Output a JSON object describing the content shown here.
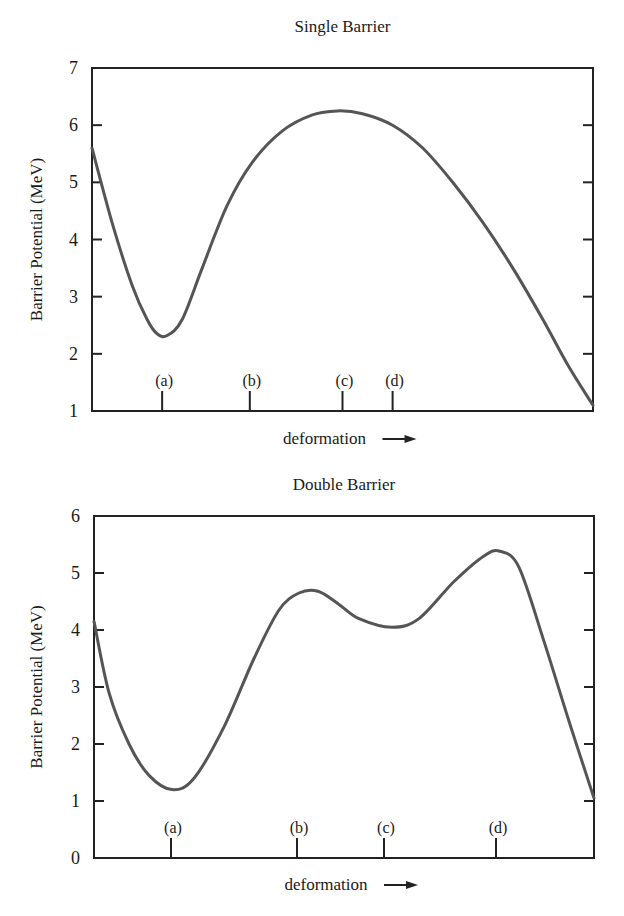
{
  "chart_data": [
    {
      "type": "line",
      "title": "Single Barrier",
      "xlabel": "deformation",
      "xlabel_arrow": "→",
      "ylabel": "Barrier Potential (MeV)",
      "ylim": [
        1,
        7
      ],
      "yticks": [
        1,
        2,
        3,
        4,
        5,
        6,
        7
      ],
      "grid": false,
      "x_markers": [
        {
          "label": "(a)",
          "x": 0.14
        },
        {
          "label": "(b)",
          "x": 0.315
        },
        {
          "label": "(c)",
          "x": 0.5
        },
        {
          "label": "(d)",
          "x": 0.6
        }
      ],
      "series": [
        {
          "name": "potential",
          "x": [
            0.0,
            0.04,
            0.08,
            0.11,
            0.13,
            0.15,
            0.18,
            0.22,
            0.27,
            0.32,
            0.38,
            0.44,
            0.49,
            0.54,
            0.6,
            0.66,
            0.72,
            0.78,
            0.84,
            0.9,
            0.95,
            1.0
          ],
          "values": [
            5.6,
            4.3,
            3.2,
            2.6,
            2.35,
            2.32,
            2.6,
            3.5,
            4.6,
            5.35,
            5.9,
            6.18,
            6.25,
            6.2,
            6.0,
            5.6,
            5.0,
            4.3,
            3.5,
            2.6,
            1.8,
            1.1
          ]
        }
      ]
    },
    {
      "type": "line",
      "title": "Double Barrier",
      "xlabel": "deformation",
      "xlabel_arrow": "→",
      "ylabel": "Barrier Potential (MeV)",
      "ylim": [
        0,
        6
      ],
      "yticks": [
        0,
        1,
        2,
        3,
        4,
        5,
        6
      ],
      "grid": false,
      "x_markers": [
        {
          "label": "(a)",
          "x": 0.154
        },
        {
          "label": "(b)",
          "x": 0.406
        },
        {
          "label": "(c)",
          "x": 0.58
        },
        {
          "label": "(d)",
          "x": 0.804
        }
      ],
      "series": [
        {
          "name": "potential",
          "x": [
            0.0,
            0.03,
            0.07,
            0.11,
            0.156,
            0.2,
            0.26,
            0.32,
            0.37,
            0.41,
            0.448,
            0.49,
            0.53,
            0.596,
            0.65,
            0.72,
            0.78,
            0.812,
            0.85,
            0.9,
            0.95,
            1.0
          ],
          "values": [
            4.15,
            2.9,
            2.0,
            1.45,
            1.2,
            1.4,
            2.3,
            3.5,
            4.35,
            4.65,
            4.68,
            4.45,
            4.2,
            4.05,
            4.2,
            4.85,
            5.3,
            5.38,
            5.1,
            3.8,
            2.4,
            1.05
          ]
        }
      ]
    }
  ],
  "charts": [
    {
      "title": "Single Barrier",
      "ylabel": "Barrier Potential (MeV)",
      "xlabel": "deformation"
    },
    {
      "title": "Double Barrier",
      "ylabel": "Barrier Potential (MeV)",
      "xlabel": "deformation"
    }
  ]
}
